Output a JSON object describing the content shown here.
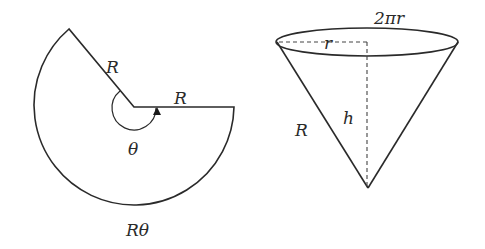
{
  "sector": {
    "radius_label_upper": "R",
    "radius_label_right": "R",
    "angle_label": "θ",
    "arc_length_label": "Rθ"
  },
  "cone": {
    "circumference_label": "2πr",
    "base_radius_label": "r",
    "height_label": "h",
    "slant_label": "R"
  },
  "colors": {
    "stroke": "#2a2a2a",
    "background": "#ffffff"
  }
}
